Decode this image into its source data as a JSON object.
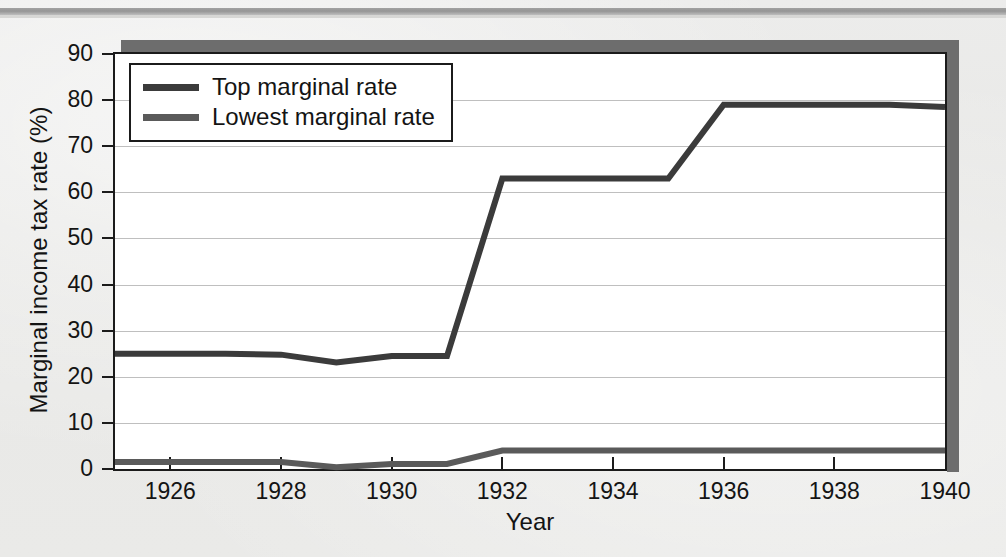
{
  "chart_data": {
    "type": "line",
    "title": "",
    "xlabel": "Year",
    "ylabel": "Marginal income tax rate (%)",
    "xlim": [
      1925,
      1940
    ],
    "ylim": [
      0,
      90
    ],
    "xticks": [
      1926,
      1928,
      1930,
      1932,
      1934,
      1936,
      1938,
      1940
    ],
    "xtick_labels": [
      "1926",
      "1928",
      "1930",
      "1932",
      "1934",
      "1936",
      "1938",
      "1940"
    ],
    "yticks": [
      0,
      10,
      20,
      30,
      40,
      50,
      60,
      70,
      80,
      90
    ],
    "ytick_labels": [
      "0",
      "10",
      "20",
      "30",
      "40",
      "50",
      "60",
      "70",
      "80",
      "90"
    ],
    "grid": "horizontal",
    "legend_position": "upper-left",
    "x": [
      1925,
      1926,
      1927,
      1928,
      1929,
      1930,
      1931,
      1932,
      1933,
      1934,
      1935,
      1936,
      1937,
      1938,
      1939,
      1940
    ],
    "series": [
      {
        "name": "Top marginal rate",
        "color": "#3b3b3b",
        "values": [
          25,
          25,
          25,
          24.8,
          23.1,
          24.5,
          24.5,
          63,
          63,
          63,
          63,
          79,
          79,
          79,
          79,
          78.5
        ]
      },
      {
        "name": "Lowest marginal rate",
        "color": "#5a5a5a",
        "values": [
          1.5,
          1.5,
          1.5,
          1.5,
          0.375,
          1.1,
          1.1,
          4,
          4,
          4,
          4,
          4,
          4,
          4,
          4,
          4
        ]
      }
    ]
  },
  "legend": {
    "items": [
      {
        "label": "Top marginal rate",
        "color": "#3b3b3b"
      },
      {
        "label": "Lowest marginal rate",
        "color": "#5a5a5a"
      }
    ]
  },
  "caption_sliver": ""
}
